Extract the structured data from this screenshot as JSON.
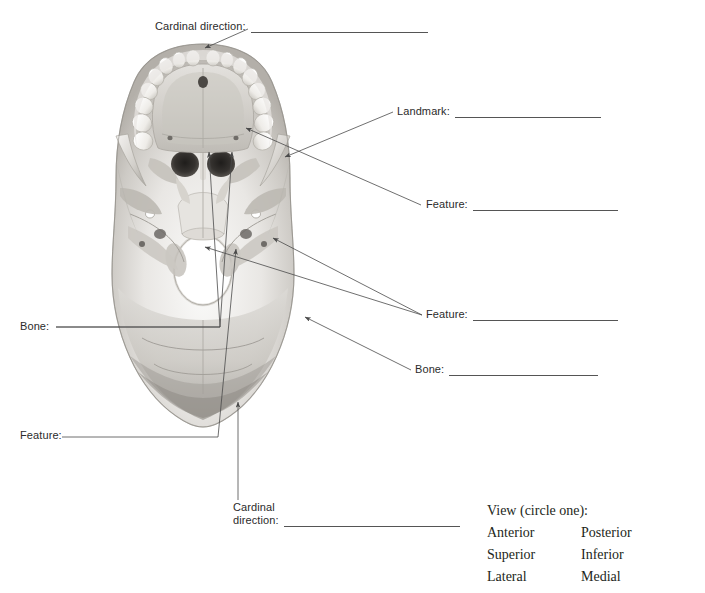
{
  "document": {
    "type": "anatomy-labeling-worksheet",
    "subject": "skull-inferior-view"
  },
  "labels": {
    "cardinal_top": "Cardinal direction:",
    "landmark": "Landmark:",
    "feature_right_upper": "Feature:",
    "feature_right_lower": "Feature:",
    "bone_right": "Bone:",
    "bone_left": "Bone:",
    "feature_left": "Feature:",
    "cardinal_bottom_line1": "Cardinal",
    "cardinal_bottom_line2": "direction:"
  },
  "view_block": {
    "title": "View (circle one):",
    "rows": [
      {
        "left": "Anterior",
        "right": "Posterior"
      },
      {
        "left": "Superior",
        "right": "Inferior"
      },
      {
        "left": "Lateral",
        "right": "Medial"
      }
    ]
  },
  "colors": {
    "text": "#231f20",
    "rule": "#555555",
    "leader": "#4a4a4a",
    "bone_light": "#f2f1ef",
    "bone_mid": "#d8d6d2",
    "bone_shadow": "#a9a6a1",
    "bone_dark": "#6f6c68",
    "aperture": "#3a3734",
    "page": "#ffffff"
  },
  "figure": {
    "caption": "Inferior view of the skull base with blank leader lines for labeling",
    "leader_count": 8
  }
}
